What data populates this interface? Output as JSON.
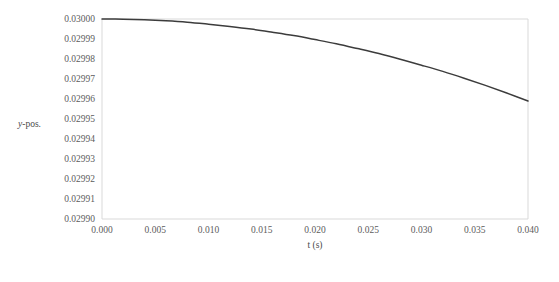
{
  "chart_data": {
    "type": "line",
    "title": "",
    "xlabel": "t (s)",
    "ylabel": "y-pos.",
    "ylabel_parts": {
      "italic": "y",
      "rest": "-pos."
    },
    "xlim": [
      0.0,
      0.04
    ],
    "ylim": [
      0.0299,
      0.03
    ],
    "grid": false,
    "legend": null,
    "line_color": "#3c3c3c",
    "axis_color": "#d9d9d9",
    "background": "#ffffff",
    "xticks": [
      0.0,
      0.005,
      0.01,
      0.015,
      0.02,
      0.025,
      0.03,
      0.035,
      0.04
    ],
    "xtick_labels": [
      "0.000",
      "0.005",
      "0.010",
      "0.015",
      "0.020",
      "0.025",
      "0.030",
      "0.035",
      "0.040"
    ],
    "yticks": [
      0.0299,
      0.02991,
      0.02992,
      0.02993,
      0.02994,
      0.02995,
      0.02996,
      0.02997,
      0.02998,
      0.02999,
      0.03
    ],
    "ytick_labels": [
      "0.02990",
      "0.02991",
      "0.02992",
      "0.02993",
      "0.02994",
      "0.02995",
      "0.02996",
      "0.02997",
      "0.02998",
      "0.02999",
      "0.03000"
    ],
    "x": [
      0.0,
      0.002,
      0.004,
      0.006,
      0.008,
      0.01,
      0.012,
      0.014,
      0.016,
      0.018,
      0.02,
      0.022,
      0.024,
      0.026,
      0.028,
      0.03,
      0.032,
      0.034,
      0.036,
      0.038,
      0.04
    ],
    "values": [
      0.03,
      0.0299999,
      0.0299996,
      0.0299991,
      0.0299984,
      0.0299974,
      0.0299963,
      0.029995,
      0.0299934,
      0.0299917,
      0.0299897,
      0.0299876,
      0.0299852,
      0.0299827,
      0.0299799,
      0.0299769,
      0.0299738,
      0.0299704,
      0.0299668,
      0.029963,
      0.029959
    ],
    "series": [
      {
        "name": "y-pos.",
        "x": [
          0.0,
          0.002,
          0.004,
          0.006,
          0.008,
          0.01,
          0.012,
          0.014,
          0.016,
          0.018,
          0.02,
          0.022,
          0.024,
          0.026,
          0.028,
          0.03,
          0.032,
          0.034,
          0.036,
          0.038,
          0.04
        ],
        "values": [
          0.03,
          0.0299999,
          0.0299996,
          0.0299991,
          0.0299984,
          0.0299974,
          0.0299963,
          0.029995,
          0.0299934,
          0.0299917,
          0.0299897,
          0.0299876,
          0.0299852,
          0.0299827,
          0.0299799,
          0.0299769,
          0.0299738,
          0.0299704,
          0.0299668,
          0.029963,
          0.029959
        ]
      }
    ]
  }
}
